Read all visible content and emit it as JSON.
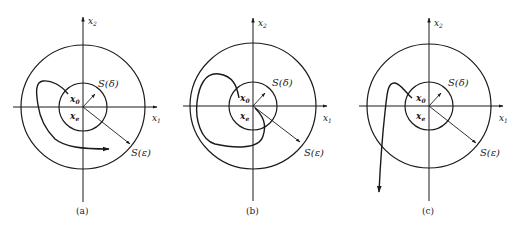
{
  "figure": {
    "type": "stability-diagrams",
    "colors": {
      "ink": "#1a1a1a",
      "background": "#ffffff"
    },
    "panels": [
      {
        "id": "a",
        "caption": "(a)",
        "axis_x_label": "x1",
        "axis_y_label": "x2",
        "initial_state_label": "x0",
        "equilibrium_label": "xe",
        "inner_region_label": "S(δ)",
        "outer_region_label": "S(ε)",
        "trajectory": "stays within S(ε) (stable)"
      },
      {
        "id": "b",
        "caption": "(b)",
        "axis_x_label": "x1",
        "axis_y_label": "x2",
        "initial_state_label": "x0",
        "equilibrium_label": "xe",
        "inner_region_label": "S(δ)",
        "outer_region_label": "S(ε)",
        "trajectory": "converges to xe (asymptotically stable)"
      },
      {
        "id": "c",
        "caption": "(c)",
        "axis_x_label": "x1",
        "axis_y_label": "x2",
        "initial_state_label": "x0",
        "equilibrium_label": "xe",
        "inner_region_label": "S(δ)",
        "outer_region_label": "S(ε)",
        "trajectory": "leaves S(ε) (unstable)"
      }
    ],
    "text": {
      "x1_main": "x",
      "x1_sub": "1",
      "x2_main": "x",
      "x2_sub": "2",
      "x0_main": "x",
      "x0_sub": "0",
      "xe_main": "x",
      "xe_sub": "e",
      "s_delta": "S(δ)",
      "s_eps": "S(ε)",
      "cap_a": "(a)",
      "cap_b": "(b)",
      "cap_c": "(c)"
    }
  }
}
